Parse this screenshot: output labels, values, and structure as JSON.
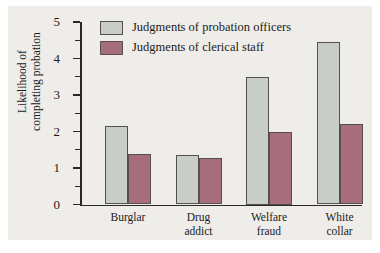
{
  "chart_data": {
    "type": "bar",
    "title": "",
    "xlabel": "",
    "ylabel": "Likelihood of completing probation",
    "ylabel_lines": [
      "Likelihood of",
      "completing probation"
    ],
    "categories": [
      "Burglar",
      "Drug addict",
      "Welfare fraud",
      "White collar"
    ],
    "category_lines": [
      [
        "Burglar"
      ],
      [
        "Drug",
        "addict"
      ],
      [
        "Welfare",
        "fraud"
      ],
      [
        "White",
        "collar"
      ]
    ],
    "series": [
      {
        "name": "Judgments of probation officers",
        "color": "#c9cdc8",
        "values": [
          2.15,
          1.35,
          3.5,
          4.45
        ]
      },
      {
        "name": "Judgments of clerical staff",
        "color": "#a86d7d",
        "values": [
          1.38,
          1.28,
          2.0,
          2.2
        ]
      }
    ],
    "ylim": [
      0,
      5
    ],
    "y_ticks": [
      0,
      1,
      2,
      3,
      4,
      5
    ],
    "y_tick_labels": [
      "0",
      "1",
      "2",
      "3",
      "4",
      "5"
    ],
    "y_minor_ticks": [
      0.5,
      1.5,
      2.5,
      3.5,
      4.5
    ],
    "grid": false,
    "legend_position": "top-left",
    "legend": [
      "Judgments of probation officers",
      "Judgments of clerical staff"
    ],
    "background_color": "#efedea",
    "axis_color": "#2b2824",
    "bar_edge_color": "#55504b"
  }
}
